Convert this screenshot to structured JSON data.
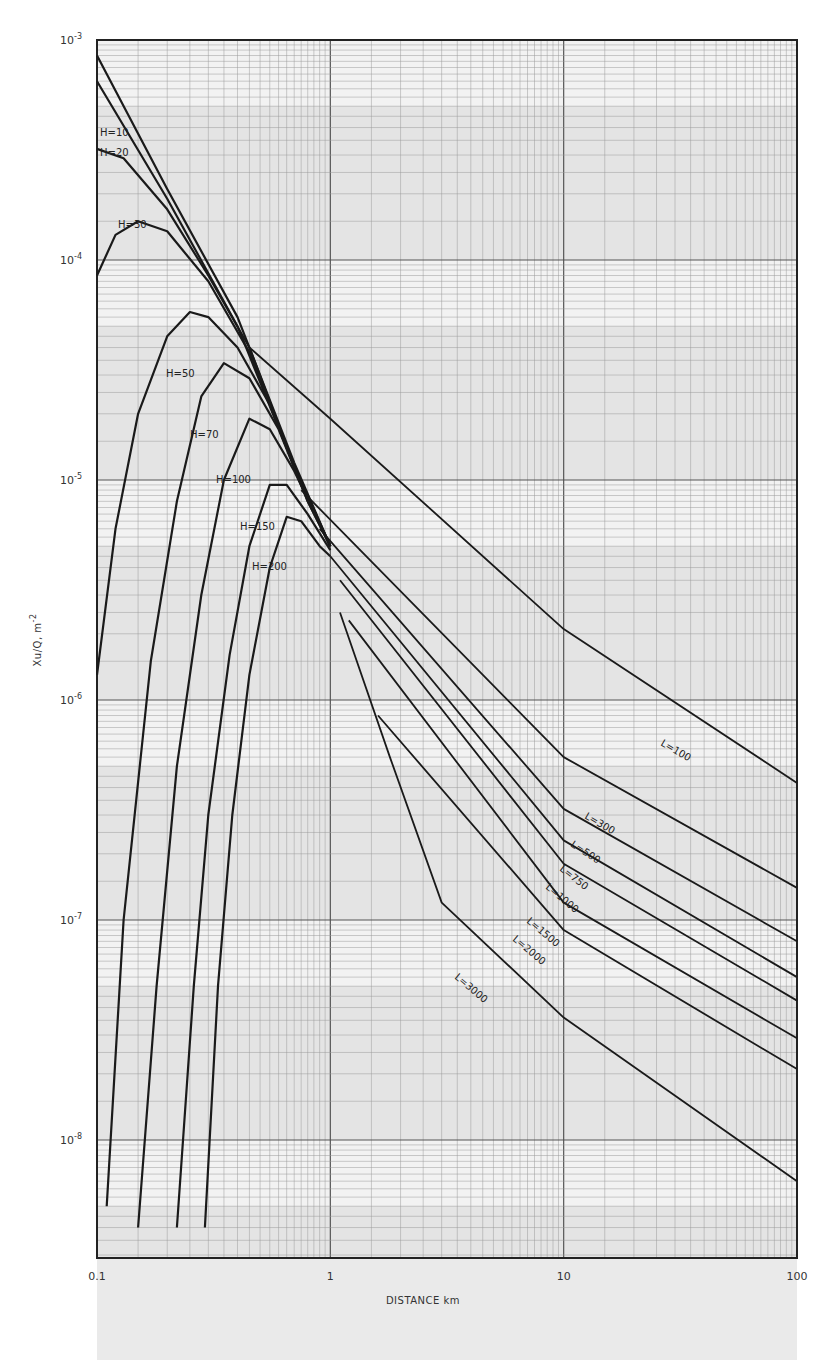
{
  "chart_data": {
    "type": "line",
    "title": "",
    "xlabel": "DISTANCE km",
    "ylabel": "Xu/Q, m^-2",
    "xscale": "log",
    "yscale": "log",
    "xlim": [
      0.1,
      100
    ],
    "ylim": [
      3e-09,
      0.001
    ],
    "grid": true,
    "legend": "inline curve labels",
    "x_tick_labels": [
      "0.1",
      "1",
      "10",
      "100"
    ],
    "y_tick_labels": [
      "10-3",
      "10-4",
      "10-5",
      "10-6",
      "10-7",
      "10-8"
    ],
    "series": [
      {
        "name": "H=0 (upper envelope)",
        "label": "",
        "points": [
          [
            0.1,
            0.00085
          ],
          [
            0.2,
            0.00021
          ],
          [
            0.4,
            5.5e-05
          ],
          [
            0.7,
            1.2e-05
          ],
          [
            1.0,
            5e-06
          ]
        ]
      },
      {
        "name": "H=10",
        "label": "H=10",
        "points": [
          [
            0.1,
            0.00065
          ],
          [
            0.2,
            0.00019
          ],
          [
            0.4,
            5e-05
          ],
          [
            0.7,
            1.15e-05
          ],
          [
            1.0,
            5e-06
          ]
        ]
      },
      {
        "name": "H=20",
        "label": "H=20",
        "points": [
          [
            0.1,
            0.00032
          ],
          [
            0.13,
            0.00029
          ],
          [
            0.2,
            0.00017
          ],
          [
            0.3,
            8.5e-05
          ],
          [
            0.45,
            4e-05
          ],
          [
            0.7,
            1.15e-05
          ],
          [
            1.0,
            5e-06
          ]
        ]
      },
      {
        "name": "H=30",
        "label": "H=30",
        "points": [
          [
            0.1,
            8.5e-05
          ],
          [
            0.12,
            0.00013
          ],
          [
            0.15,
            0.00015
          ],
          [
            0.2,
            0.000135
          ],
          [
            0.3,
            8e-05
          ],
          [
            0.45,
            3.8e-05
          ],
          [
            0.7,
            1.15e-05
          ],
          [
            1.0,
            5e-06
          ]
        ]
      },
      {
        "name": "H=50",
        "label": "H=50",
        "points": [
          [
            0.1,
            1.3e-06
          ],
          [
            0.12,
            6e-06
          ],
          [
            0.15,
            2e-05
          ],
          [
            0.2,
            4.5e-05
          ],
          [
            0.25,
            5.8e-05
          ],
          [
            0.3,
            5.5e-05
          ],
          [
            0.4,
            4e-05
          ],
          [
            0.55,
            2.2e-05
          ],
          [
            0.8,
            8e-06
          ],
          [
            1.0,
            5e-06
          ]
        ]
      },
      {
        "name": "H=70",
        "label": "H=70",
        "points": [
          [
            0.11,
            5e-09
          ],
          [
            0.13,
            1e-07
          ],
          [
            0.17,
            1.5e-06
          ],
          [
            0.22,
            8e-06
          ],
          [
            0.28,
            2.4e-05
          ],
          [
            0.35,
            3.4e-05
          ],
          [
            0.45,
            2.9e-05
          ],
          [
            0.6,
            1.7e-05
          ],
          [
            0.8,
            8e-06
          ],
          [
            1.0,
            5e-06
          ]
        ]
      },
      {
        "name": "H=100",
        "label": "H=100",
        "points": [
          [
            0.15,
            4e-09
          ],
          [
            0.18,
            5e-08
          ],
          [
            0.22,
            5e-07
          ],
          [
            0.28,
            3e-06
          ],
          [
            0.35,
            1e-05
          ],
          [
            0.45,
            1.9e-05
          ],
          [
            0.55,
            1.7e-05
          ],
          [
            0.7,
            1.1e-05
          ],
          [
            1.0,
            5e-06
          ]
        ]
      },
      {
        "name": "H=150",
        "label": "H=150",
        "points": [
          [
            0.22,
            4e-09
          ],
          [
            0.26,
            5e-08
          ],
          [
            0.3,
            3e-07
          ],
          [
            0.37,
            1.6e-06
          ],
          [
            0.45,
            5e-06
          ],
          [
            0.55,
            9.5e-06
          ],
          [
            0.65,
            9.5e-06
          ],
          [
            0.8,
            7e-06
          ],
          [
            1.0,
            4.8e-06
          ]
        ]
      },
      {
        "name": "H=200",
        "label": "H=200",
        "points": [
          [
            0.29,
            4e-09
          ],
          [
            0.33,
            5e-08
          ],
          [
            0.38,
            3e-07
          ],
          [
            0.45,
            1.3e-06
          ],
          [
            0.55,
            4e-06
          ],
          [
            0.65,
            6.8e-06
          ],
          [
            0.75,
            6.5e-06
          ],
          [
            0.9,
            5e-06
          ],
          [
            1.0,
            4.5e-06
          ]
        ]
      },
      {
        "name": "L=100",
        "label": "L=100",
        "points": [
          [
            0.45,
            4e-05
          ],
          [
            1.0,
            1.9e-05
          ],
          [
            10,
            2.1e-06
          ],
          [
            100,
            4.2e-07
          ]
        ]
      },
      {
        "name": "L=300",
        "label": "L=300",
        "points": [
          [
            0.75,
            9e-06
          ],
          [
            10,
            5.5e-07
          ],
          [
            100,
            1.4e-07
          ]
        ]
      },
      {
        "name": "L=500",
        "label": "L=500",
        "points": [
          [
            0.9,
            6e-06
          ],
          [
            10,
            3.2e-07
          ],
          [
            100,
            8e-08
          ]
        ]
      },
      {
        "name": "L=750",
        "label": "L=750",
        "points": [
          [
            1.0,
            4.5e-06
          ],
          [
            10,
            2.3e-07
          ],
          [
            100,
            5.5e-08
          ]
        ]
      },
      {
        "name": "L=1000",
        "label": "L=1000",
        "points": [
          [
            1.1,
            3.5e-06
          ],
          [
            10,
            1.8e-07
          ],
          [
            100,
            4.3e-08
          ]
        ]
      },
      {
        "name": "L=1500",
        "label": "L=1500",
        "points": [
          [
            1.2,
            2.3e-06
          ],
          [
            10,
            1.2e-07
          ],
          [
            100,
            2.9e-08
          ]
        ]
      },
      {
        "name": "L=2000",
        "label": "L=2000",
        "points": [
          [
            1.6,
            8.5e-07
          ],
          [
            10,
            9e-08
          ],
          [
            100,
            2.1e-08
          ]
        ]
      },
      {
        "name": "L=3000",
        "label": "L=3000",
        "points": [
          [
            1.1,
            2.5e-06
          ],
          [
            1.8,
            5.5e-07
          ],
          [
            3.0,
            1.2e-07
          ],
          [
            10,
            3.6e-08
          ],
          [
            100,
            6.5e-09
          ]
        ]
      }
    ]
  },
  "axes": {
    "x_title": "DISTANCE km",
    "y_title": "Xu/Q, m",
    "y_title_exp": "-2",
    "x_ticks": [
      {
        "label": "0.1",
        "value": 0.1
      },
      {
        "label": "1",
        "value": 1
      },
      {
        "label": "10",
        "value": 10
      },
      {
        "label": "100",
        "value": 100
      }
    ],
    "y_ticks": [
      {
        "base": "10",
        "exp": "-3",
        "value": 0.001
      },
      {
        "base": "10",
        "exp": "-4",
        "value": 0.0001
      },
      {
        "base": "10",
        "exp": "-5",
        "value": 1e-05
      },
      {
        "base": "10",
        "exp": "-6",
        "value": 1e-06
      },
      {
        "base": "10",
        "exp": "-7",
        "value": 1e-07
      },
      {
        "base": "10",
        "exp": "-8",
        "value": 1e-08
      }
    ]
  },
  "colors": {
    "curve": "#1a1a1a",
    "grid_minor": "#9a9a9a",
    "grid_major": "#555555",
    "paper": "#f2f2f2",
    "band": "#d8d8d8"
  }
}
